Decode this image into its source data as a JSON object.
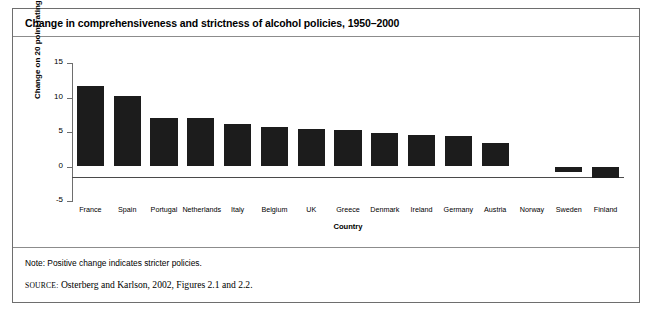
{
  "figure": {
    "title": "Change in comprehensiveness and strictness of alcohol policies, 1950–2000",
    "note": "Note: Positive change indicates stricter policies.",
    "source_label": "SOURCE:",
    "source_text": "Osterberg and Karlson, 2002, Figures 2.1 and 2.2.",
    "colors": {
      "bar": "#1c1c1c",
      "axis": "#6e6e6e",
      "frame": "#6e6e6e",
      "text": "#000000",
      "background": "#ffffff"
    }
  },
  "chart_data": {
    "type": "bar",
    "title": "Change in comprehensiveness and strictness of alcohol policies, 1950–2000",
    "xlabel": "Country",
    "ylabel": "Change on 20 point rating scale",
    "categories": [
      "France",
      "Spain",
      "Portugal",
      "Netherlands",
      "Italy",
      "Belgium",
      "UK",
      "Greece",
      "Denmark",
      "Ireland",
      "Germany",
      "Austria",
      "Norway",
      "Sweden",
      "Finland"
    ],
    "values": [
      11.7,
      10.2,
      7.1,
      7.1,
      6.1,
      5.7,
      5.5,
      5.3,
      4.9,
      4.5,
      4.4,
      3.4,
      0.0,
      -0.8,
      -1.7
    ],
    "ylim": [
      -5,
      15
    ],
    "yticks": [
      15,
      10,
      5,
      0,
      -5
    ],
    "ytick_labels": [
      "15",
      "10",
      "5",
      "0",
      "-5"
    ],
    "grid": false,
    "legend": null
  }
}
